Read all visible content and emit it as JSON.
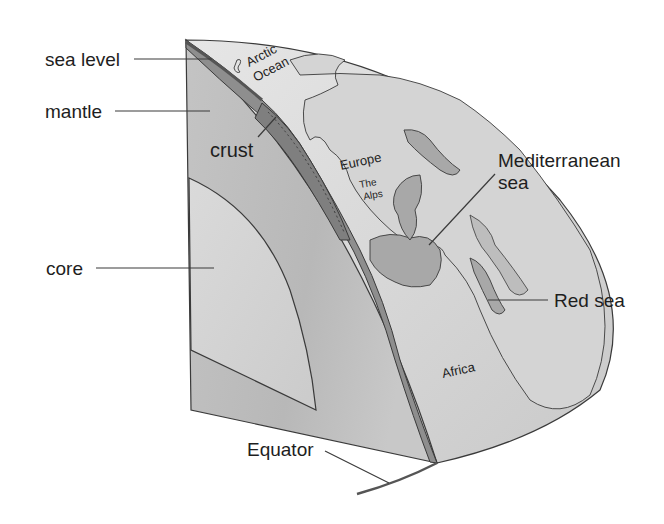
{
  "diagram": {
    "labels": {
      "sea_level": "sea level",
      "mantle": "mantle",
      "crust": "crust",
      "core": "core",
      "arctic_1": "Arctic",
      "arctic_2": "Ocean",
      "europe": "Europe",
      "alps_1": "The",
      "alps_2": "Alps",
      "mediterranean_1": "Mediterranean",
      "mediterranean_2": "sea",
      "red_sea": "Red sea",
      "africa": "Africa",
      "equator": "Equator"
    },
    "colors": {
      "core": "#d2d2d2",
      "mantle": "#c0c0c0",
      "crust": "#8e8e8e",
      "ocean": "#e4e4e4",
      "land": "#cfcfcf",
      "sea_water": "#a8a8a8",
      "outline": "#3a3a3a"
    }
  }
}
